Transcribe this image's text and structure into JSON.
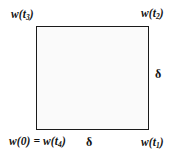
{
  "figure": {
    "type": "square-diagram",
    "colors": {
      "stroke": "#1a1a1a",
      "text": "#111111",
      "background": "#ffffff",
      "fill": "#fafafa"
    },
    "corner_labels": {
      "top_left": {
        "base": "w(t",
        "sub": "3",
        "close": ")"
      },
      "top_right": {
        "base": "w(t",
        "sub": "2",
        "close": ")"
      },
      "bottom_left": {
        "prefix": "w(0) = w(t",
        "sub": "4",
        "close": ")"
      },
      "bottom_right": {
        "base": "w(t",
        "sub": "1",
        "close": ")"
      }
    },
    "side_labels": {
      "right": "δ",
      "bottom": "δ"
    }
  }
}
